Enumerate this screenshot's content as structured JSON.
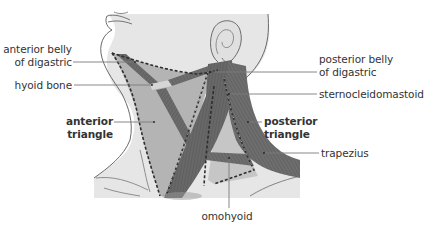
{
  "diagram": {
    "colors": {
      "background": "#ffffff",
      "skin": "#e6e6e6",
      "skin_outline": "#6a6a6a",
      "anterior_triangle_fill": "#b4b4b4",
      "posterior_triangle_fill": "#c4c4c4",
      "muscle": "#6b6b6b",
      "muscle_dark": "#555555",
      "hyoid": "#d4d4d4",
      "dashed_boundary": "#2e2e2e",
      "dot_markers": "#ffffff",
      "leader_line": "#7a7a7a",
      "text": "#333333"
    },
    "labels": {
      "anterior_belly_line1": "anterior belly",
      "anterior_belly_line2": "of digastric",
      "hyoid_bone": "hyoid bone",
      "anterior_triangle_line1": "anterior",
      "anterior_triangle_line2": "triangle",
      "posterior_belly_line1": "posterior belly",
      "posterior_belly_line2": "of digastric",
      "sternocleidomastoid": "sternocleidomastoid",
      "posterior_triangle_line1": "posterior",
      "posterior_triangle_line2": "triangle",
      "trapezius": "trapezius",
      "omohyoid": "omohyoid"
    }
  }
}
